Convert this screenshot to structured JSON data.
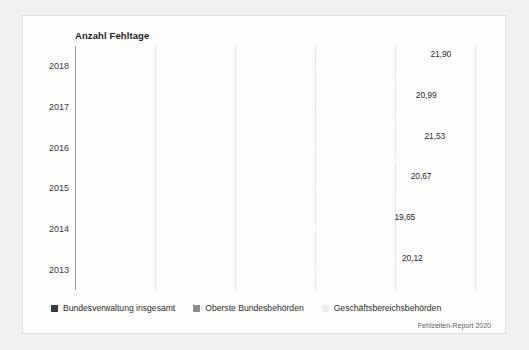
{
  "card": {
    "title": "Anzahl Fehltage",
    "source": "Fehlzeiten-Report 2020"
  },
  "legend": {
    "items": [
      {
        "label": "Bundesverwaltung insgesamt",
        "color": "#3b3b3d"
      },
      {
        "label": "Oberste Bundesbehörden",
        "color": "#8e8d8b"
      },
      {
        "label": "Geschäftsbereichsbehörden",
        "color": "#f0eeec"
      }
    ]
  },
  "chart_data": {
    "type": "bar",
    "orientation": "horizontal",
    "title": "Anzahl Fehltage",
    "xlabel": "",
    "ylabel": "",
    "grid": true,
    "legend_position": "bottom",
    "xlim": [
      0,
      25
    ],
    "categories": [
      "2018",
      "2017",
      "2016",
      "2015",
      "2014",
      "2013"
    ],
    "series": [
      {
        "name": "Geschäftsbereichsbehörden",
        "color": "#f0eeec",
        "values": [
          21.9,
          20.99,
          21.53,
          20.67,
          19.65,
          20.12
        ],
        "labels": [
          "21,90",
          "20,99",
          "21,53",
          "20,67",
          "19,65",
          "20,12"
        ]
      },
      {
        "name": "Oberste Bundesbehörden",
        "color": "#8e8d8b",
        "values": [
          16.36,
          16.5,
          16.2,
          16.24,
          15.23,
          15.94
        ],
        "labels": [
          "16,36",
          "16,50",
          "16,20",
          "16,24",
          "15,23",
          "15,94"
        ]
      },
      {
        "name": "Bundesverwaltung insgesamt",
        "color": "#3b3b3d",
        "values": [
          21.35,
          20.55,
          21.01,
          20.25,
          19.25,
          19.75
        ],
        "labels": [
          "21,35",
          "20,55",
          "21,01",
          "20,25",
          "19,25",
          "19,75"
        ]
      }
    ]
  }
}
